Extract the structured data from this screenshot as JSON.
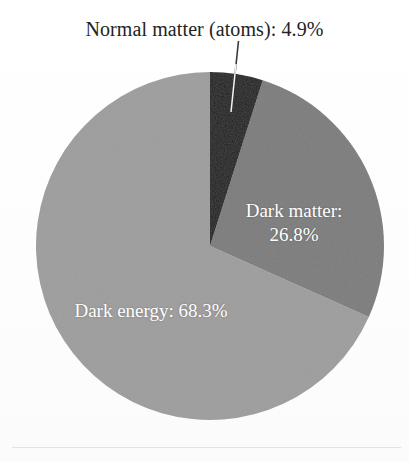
{
  "figure": {
    "background_color": "#fefefe",
    "callout": {
      "text": "Normal matter (atoms): 4.9%",
      "color": "#232323"
    },
    "labels": {
      "dark_matter_line1": "Dark matter:",
      "dark_matter_line2": "26.8%",
      "dark_energy": "Dark energy: 68.3%",
      "label_color": "#ffffff"
    }
  },
  "chart_data": {
    "type": "pie",
    "title": "",
    "subtitle": "",
    "xlabel": "",
    "ylabel": "",
    "grid": false,
    "legend_position": "none",
    "units": "percent",
    "start_angle_deg": 0,
    "direction": "clockwise",
    "total": 100.0,
    "categories": [
      "Normal matter (atoms)",
      "Dark matter",
      "Dark energy"
    ],
    "values": [
      4.9,
      26.8,
      68.3
    ],
    "colors": [
      "#1e1e1e",
      "#7c7c7c",
      "#9d9d9d"
    ],
    "slices": [
      {
        "name": "Normal matter (atoms)",
        "value": 4.9,
        "label": "Normal matter (atoms): 4.9%",
        "color": "#1e1e1e",
        "label_placement": "outside",
        "has_leader_line": true
      },
      {
        "name": "Dark matter",
        "value": 26.8,
        "label": "Dark matter: 26.8%",
        "color": "#7c7c7c",
        "label_placement": "inside",
        "has_leader_line": false
      },
      {
        "name": "Dark energy",
        "value": 68.3,
        "label": "Dark energy: 68.3%",
        "color": "#9d9d9d",
        "label_placement": "inside",
        "has_leader_line": false
      }
    ],
    "geometry": {
      "center_x": 210,
      "center_y": 246,
      "radius": 174
    }
  }
}
